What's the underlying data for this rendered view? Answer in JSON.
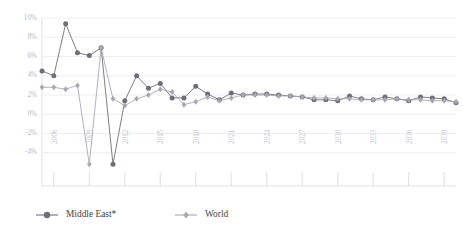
{
  "chart_data": {
    "type": "line",
    "title": "",
    "subtitle": "",
    "xlabel": "",
    "ylabel": "",
    "ylim": [
      -6,
      10
    ],
    "y_ticks": [
      "10%",
      "8%",
      "6%",
      "4%",
      "2%",
      "0%",
      "-2%",
      "-4%"
    ],
    "y_tick_values": [
      10,
      8,
      6,
      4,
      2,
      0,
      -2,
      -4
    ],
    "x": [
      2005,
      2006,
      2007,
      2008,
      2009,
      2010,
      2011,
      2012,
      2013,
      2014,
      2015,
      2016,
      2017,
      2018,
      2019,
      2020,
      2021,
      2022,
      2023,
      2024,
      2025,
      2026,
      2027,
      2028,
      2029,
      2030,
      2031,
      2032,
      2033,
      2034,
      2035,
      2036,
      2037,
      2038,
      2039,
      2040
    ],
    "x_tick_labels": [
      "2006",
      "2009",
      "2012",
      "2015",
      "2018",
      "2021",
      "2024",
      "2027",
      "2030",
      "2033",
      "2036",
      "2039"
    ],
    "x_tick_values": [
      2006,
      2009,
      2012,
      2015,
      2018,
      2021,
      2024,
      2027,
      2030,
      2033,
      2036,
      2039
    ],
    "grid": true,
    "legend_position": "bottom",
    "series": [
      {
        "name": "Middle East*",
        "color": "#6e6e78",
        "marker": "circle",
        "values": [
          4.5,
          4.0,
          9.4,
          6.4,
          6.1,
          6.9,
          -5.2,
          1.4,
          4.0,
          2.7,
          3.2,
          1.7,
          1.7,
          2.9,
          2.1,
          1.5,
          2.2,
          2.0,
          2.1,
          2.1,
          2.0,
          1.9,
          1.8,
          1.5,
          1.5,
          1.4,
          1.9,
          1.6,
          1.5,
          1.8,
          1.6,
          1.4,
          1.8,
          1.7,
          1.6,
          1.2
        ]
      },
      {
        "name": "World",
        "color": "#a8a8b4",
        "marker": "diamond",
        "values": [
          2.8,
          2.8,
          2.6,
          3.0,
          -5.2,
          6.9,
          1.6,
          0.9,
          1.6,
          2.0,
          2.6,
          2.3,
          1.0,
          1.3,
          1.8,
          1.4,
          1.7,
          2.0,
          2.0,
          2.0,
          1.9,
          1.9,
          1.8,
          1.7,
          1.7,
          1.6,
          1.6,
          1.5,
          1.5,
          1.5,
          1.6,
          1.5,
          1.5,
          1.4,
          1.4,
          1.3
        ]
      }
    ]
  },
  "legend": {
    "items": [
      {
        "label": "Middle East*",
        "color": "#6e6e78",
        "marker": "circle"
      },
      {
        "label": "World",
        "color": "#a8a8b4",
        "marker": "diamond"
      }
    ]
  },
  "colors": {
    "middle_east": "#6e6e78",
    "world": "#a8a8b4",
    "gridline": "#e9e9ef",
    "tick_text": "#bdbdc8",
    "legend_text": "#3f3f46",
    "background": "#ffffff"
  }
}
